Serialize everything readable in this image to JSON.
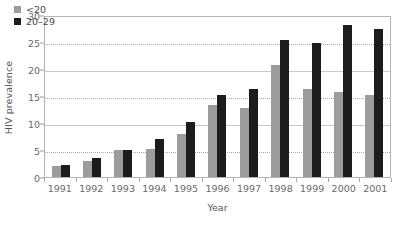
{
  "chart_data": {
    "type": "bar",
    "title": "",
    "subtitle": "",
    "xlabel": "Year",
    "ylabel": "HIV prevalence",
    "categories": [
      "1991",
      "1992",
      "1993",
      "1994",
      "1995",
      "1996",
      "1997",
      "1998",
      "1999",
      "2000",
      "2001"
    ],
    "series": [
      {
        "name": "<20",
        "color": "#9c9c9c",
        "values": [
          2.1,
          3.0,
          5.0,
          5.3,
          8.0,
          13.5,
          13.0,
          21.0,
          16.5,
          16.0,
          15.3
        ]
      },
      {
        "name": "20–29",
        "color": "#1c1c1c",
        "values": [
          2.2,
          3.5,
          5.0,
          7.2,
          10.3,
          15.3,
          16.5,
          25.7,
          25.2,
          28.5,
          27.8
        ]
      }
    ],
    "ylim": [
      0,
      30
    ],
    "yticks": [
      0,
      5,
      10,
      15,
      20,
      25,
      30
    ],
    "ytick_labels": [
      "0",
      "5",
      "10",
      "15",
      "20",
      "25",
      "30"
    ],
    "grid": "horizontal",
    "legend_position": "top-left",
    "axis_color": "#b4b4b4",
    "grid_color": "#c8c8c8",
    "background": "#ffffff"
  },
  "legend": {
    "items": [
      {
        "label": "<20",
        "swatch": "young"
      },
      {
        "label": "20–29",
        "swatch": "older"
      }
    ]
  }
}
